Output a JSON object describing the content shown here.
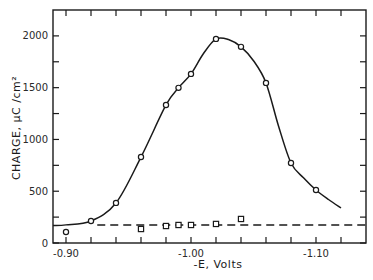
{
  "chart_data": {
    "type": "line",
    "title": "",
    "xlabel": "-E, Volts",
    "ylabel": "CHARGE, μC /cm²",
    "xlim": [
      -0.88,
      -1.14
    ],
    "ylim": [
      0,
      2250
    ],
    "x_axis_reversed_sign": "values plotted as -E increasing to the right (more negative potential)",
    "x_ticks": [
      -0.9,
      -0.92,
      -0.94,
      -0.96,
      -0.98,
      -1.0,
      -1.02,
      -1.04,
      -1.06,
      -1.08,
      -1.1,
      -1.12
    ],
    "x_tick_labels": [
      "-0.90",
      "",
      "",
      "",
      "",
      "-1.00",
      "",
      "",
      "",
      "",
      "-1.10",
      ""
    ],
    "y_ticks": [
      0,
      250,
      500,
      750,
      1000,
      1250,
      1500,
      1750,
      2000
    ],
    "y_tick_labels": [
      "0",
      "",
      "500",
      "",
      "1000",
      "",
      "1500",
      "",
      "2000"
    ],
    "grid": false,
    "legend": null,
    "series": [
      {
        "name": "circles (solid smooth curve)",
        "marker": "circle",
        "line": "solid",
        "points": [
          {
            "x": -0.9,
            "y": 106
          },
          {
            "x": -0.92,
            "y": 213
          },
          {
            "x": -0.94,
            "y": 387
          },
          {
            "x": -0.96,
            "y": 830
          },
          {
            "x": -0.98,
            "y": 1333
          },
          {
            "x": -0.99,
            "y": 1498
          },
          {
            "x": -1.0,
            "y": 1633
          },
          {
            "x": -1.02,
            "y": 1971
          },
          {
            "x": -1.04,
            "y": 1894
          },
          {
            "x": -1.06,
            "y": 1546
          },
          {
            "x": -1.08,
            "y": 773
          },
          {
            "x": -1.1,
            "y": 512
          }
        ],
        "curve": [
          {
            "x": -0.88,
            "y": 170
          },
          {
            "x": -0.9,
            "y": 175
          },
          {
            "x": -0.92,
            "y": 213
          },
          {
            "x": -0.94,
            "y": 387
          },
          {
            "x": -0.96,
            "y": 830
          },
          {
            "x": -0.98,
            "y": 1333
          },
          {
            "x": -0.99,
            "y": 1498
          },
          {
            "x": -1.0,
            "y": 1633
          },
          {
            "x": -1.01,
            "y": 1830
          },
          {
            "x": -1.02,
            "y": 1971
          },
          {
            "x": -1.03,
            "y": 1965
          },
          {
            "x": -1.04,
            "y": 1894
          },
          {
            "x": -1.05,
            "y": 1760
          },
          {
            "x": -1.06,
            "y": 1546
          },
          {
            "x": -1.07,
            "y": 1130
          },
          {
            "x": -1.08,
            "y": 773
          },
          {
            "x": -1.09,
            "y": 630
          },
          {
            "x": -1.1,
            "y": 512
          },
          {
            "x": -1.11,
            "y": 420
          },
          {
            "x": -1.12,
            "y": 338
          }
        ]
      },
      {
        "name": "squares (dashed baseline)",
        "marker": "square",
        "line": "dashed",
        "points": [
          {
            "x": -0.96,
            "y": 135
          },
          {
            "x": -0.98,
            "y": 164
          },
          {
            "x": -0.99,
            "y": 174
          },
          {
            "x": -1.0,
            "y": 174
          },
          {
            "x": -1.02,
            "y": 184
          },
          {
            "x": -1.04,
            "y": 232
          }
        ],
        "baseline": {
          "from_x": -0.925,
          "to_x": -1.14,
          "y": 174
        }
      }
    ]
  }
}
